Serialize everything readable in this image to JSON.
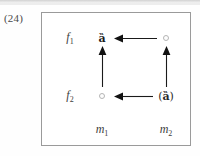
{
  "item": {
    "number": "(24)"
  },
  "diagram": {
    "type": "grid-arrow-diagram",
    "rows": [
      {
        "id": "f1",
        "label": "f",
        "subscript": "1"
      },
      {
        "id": "f2",
        "label": "f",
        "subscript": "2"
      }
    ],
    "columns": [
      {
        "id": "m1",
        "label": "m",
        "subscript": "1"
      },
      {
        "id": "m2",
        "label": "m",
        "subscript": "2"
      }
    ],
    "cells": [
      {
        "id": "cell-f1-m1",
        "row": "f1",
        "column": "m1",
        "marker": "dark-glyph",
        "text": "ȁ"
      },
      {
        "id": "cell-f1-m2",
        "row": "f1",
        "column": "m2",
        "marker": "faint-circle",
        "text": ""
      },
      {
        "id": "cell-f2-m1",
        "row": "f2",
        "column": "m1",
        "marker": "faint-circle",
        "text": ""
      },
      {
        "id": "cell-f2-m2",
        "row": "f2",
        "column": "m2",
        "marker": "parenthesized-glyph",
        "text_open": "(",
        "text_inner": "ȁ",
        "text_close": ")"
      }
    ],
    "arrows": [
      {
        "id": "arrow-top-leftward",
        "direction": "left",
        "orientation": "horizontal",
        "from": "cell-f1-m2",
        "to": "cell-f1-m1"
      },
      {
        "id": "arrow-bottom-leftward",
        "direction": "left",
        "orientation": "horizontal",
        "from": "cell-f2-m2",
        "to": "cell-f2-m1"
      },
      {
        "id": "arrow-left-upward",
        "direction": "up",
        "orientation": "vertical",
        "from": "cell-f2-m1",
        "to": "cell-f1-m1"
      },
      {
        "id": "arrow-right-upward",
        "direction": "up",
        "orientation": "vertical",
        "from": "cell-f2-m2",
        "to": "cell-f1-m2"
      }
    ],
    "colors": {
      "border": "#9a9a9a",
      "arrow": "#1a1a1a",
      "label": "#3d3d3d",
      "marker_faint": "#b4b4b4",
      "marker_dark": "#1b1b1b"
    }
  }
}
